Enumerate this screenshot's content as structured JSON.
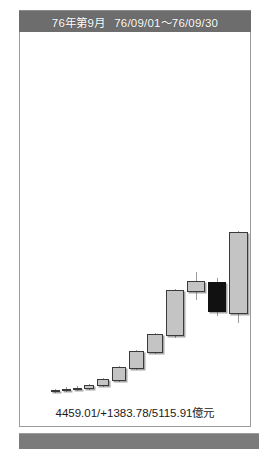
{
  "header": {
    "period_label": "76年第9月",
    "date_range": "76/09/01～76/09/30"
  },
  "footer": {
    "summary": "4459.01/+1383.78/5115.91億元"
  },
  "colors": {
    "header_bg": "#6d6d6d",
    "panel_bg": "#ffffff",
    "panel_border": "#9a9a9a",
    "up_fill": "#c4c4c4",
    "up_border": "#3a3a3a",
    "down_fill": "#111111",
    "wick": "#9b9b9b",
    "bottom_strip": "#7b7b7b",
    "text": "#1a1a1a"
  },
  "chart_data": {
    "type": "candlestick",
    "xlabel": "",
    "ylabel": "億元",
    "grid": false,
    "legend": null,
    "annotations": [
      "4459.01/+1383.78/5115.91億元"
    ],
    "value_summary": {
      "open_or_prev": 4459.01,
      "change": 1383.78,
      "close_or_total": 5115.91,
      "unit": "億元"
    },
    "axis_note": "y-axis unlabeled; candle geometry read from pixels (top of plot = highest value)",
    "candles": [
      {
        "index": 1,
        "x": 31,
        "w": 9,
        "open_px": 392,
        "close_px": 390,
        "high_px": 389,
        "low_px": 393,
        "direction": "up"
      },
      {
        "index": 2,
        "x": 42,
        "w": 9,
        "open_px": 391,
        "close_px": 389,
        "high_px": 387,
        "low_px": 392,
        "direction": "up"
      },
      {
        "index": 3,
        "x": 53,
        "w": 9,
        "open_px": 390,
        "close_px": 388,
        "high_px": 386,
        "low_px": 391,
        "direction": "up"
      },
      {
        "index": 4,
        "x": 64,
        "w": 10,
        "open_px": 389,
        "close_px": 385,
        "high_px": 384,
        "low_px": 390,
        "direction": "up"
      },
      {
        "index": 5,
        "x": 77,
        "w": 12,
        "open_px": 386,
        "close_px": 379,
        "high_px": 378,
        "low_px": 387,
        "direction": "up"
      },
      {
        "index": 6,
        "x": 92,
        "w": 14,
        "open_px": 381,
        "close_px": 367,
        "high_px": 366,
        "low_px": 382,
        "direction": "up"
      },
      {
        "index": 7,
        "x": 109,
        "w": 15,
        "open_px": 369,
        "close_px": 351,
        "high_px": 350,
        "low_px": 370,
        "direction": "up"
      },
      {
        "index": 8,
        "x": 127,
        "w": 16,
        "open_px": 353,
        "close_px": 334,
        "high_px": 333,
        "low_px": 354,
        "direction": "up"
      },
      {
        "index": 9,
        "x": 146,
        "w": 18,
        "open_px": 336,
        "close_px": 290,
        "high_px": 289,
        "low_px": 338,
        "direction": "up"
      },
      {
        "index": 10,
        "x": 167,
        "w": 18,
        "open_px": 292,
        "close_px": 281,
        "high_px": 272,
        "low_px": 300,
        "direction": "up"
      },
      {
        "index": 11,
        "x": 188,
        "w": 18,
        "open_px": 282,
        "close_px": 312,
        "high_px": 278,
        "low_px": 316,
        "direction": "down"
      },
      {
        "index": 12,
        "x": 209,
        "w": 19,
        "open_px": 314,
        "close_px": 232,
        "high_px": 231,
        "low_px": 323,
        "direction": "up"
      },
      {
        "index": 13,
        "x": 231,
        "w": 20,
        "open_px": 234,
        "close_px": 102,
        "high_px": 100,
        "low_px": 240,
        "direction": "up"
      }
    ]
  }
}
